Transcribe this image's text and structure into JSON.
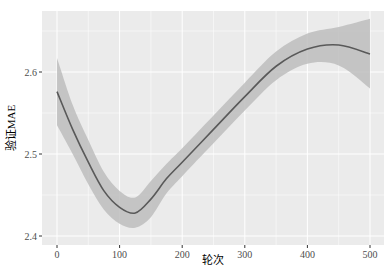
{
  "chart_data": {
    "type": "line",
    "title": "",
    "xlabel": "轮次",
    "ylabel": "验证MAE",
    "xlim": [
      -12,
      517
    ],
    "ylim": [
      2.4,
      2.685
    ],
    "xticks": [
      0,
      100,
      200,
      300,
      400,
      500
    ],
    "yticks": [
      2.4,
      2.5,
      2.6
    ],
    "ytick_labels": [
      "2.4",
      "2.5",
      "2.6"
    ],
    "xtick_labels": [
      "0",
      "100",
      "200",
      "300",
      "400",
      "500"
    ],
    "grid": true,
    "legend": null,
    "series": [
      {
        "name": "smoothed validation MAE",
        "color": "#595959",
        "x": [
          0,
          25,
          50,
          75,
          100,
          125,
          150,
          175,
          200,
          250,
          300,
          350,
          400,
          450,
          500
        ],
        "values": [
          2.576,
          2.53,
          2.49,
          2.455,
          2.435,
          2.428,
          2.445,
          2.47,
          2.49,
          2.53,
          2.57,
          2.607,
          2.628,
          2.633,
          2.622
        ],
        "ci_lower": [
          2.535,
          2.5,
          2.463,
          2.432,
          2.415,
          2.41,
          2.423,
          2.452,
          2.473,
          2.513,
          2.553,
          2.59,
          2.61,
          2.608,
          2.58
        ],
        "ci_upper": [
          2.617,
          2.56,
          2.517,
          2.478,
          2.455,
          2.447,
          2.467,
          2.488,
          2.507,
          2.547,
          2.587,
          2.625,
          2.647,
          2.655,
          2.665
        ],
        "band_color": "#bdbdbd"
      }
    ]
  },
  "panel_bg": "#ebebeb",
  "grid_color": "#ffffff"
}
